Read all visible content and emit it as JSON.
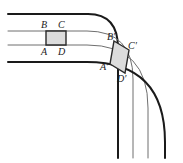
{
  "figure": {
    "canvas": {
      "width": 183,
      "height": 163
    },
    "colors": {
      "outer_stroke": "#1a1a1a",
      "inner_stroke": "#6f6f6f",
      "shape_stroke": "#2a2a2a",
      "shape_fill": "#dcdcdc",
      "background": "#ffffff",
      "label_color": "#1a1a1a"
    },
    "stroke_widths": {
      "outer": 2.0,
      "inner": 1.0,
      "shape": 1.4
    },
    "lanes": [
      {
        "name": "lane-edge-outer-top",
        "weight": "thick",
        "straight_y": 14,
        "vertical_x": 118,
        "corner_radius": 30
      },
      {
        "name": "lane-divider-upper",
        "weight": "thin",
        "straight_y": 31,
        "vertical_x": 133,
        "corner_radius": 46
      },
      {
        "name": "lane-divider-lower",
        "weight": "thin",
        "straight_y": 45,
        "vertical_x": 148,
        "corner_radius": 61
      },
      {
        "name": "lane-edge-outer-bottom",
        "weight": "thick",
        "straight_y": 62,
        "vertical_x": 165,
        "corner_radius": 78
      }
    ],
    "square": {
      "name": "square-ABCD",
      "points": "46,31 66,31 66,45 46,45",
      "fill": "#dcdcdc"
    },
    "parallelogram": {
      "name": "parallelogram-A-prime-B-prime-C-prime-D-prime",
      "points": "114,41 129,50 125,73 110,64",
      "fill": "#dcdcdc"
    },
    "labels": [
      {
        "id": "B",
        "text": "B",
        "x": 41,
        "y": 20
      },
      {
        "id": "C",
        "text": "C",
        "x": 58,
        "y": 20
      },
      {
        "id": "A",
        "text": "A",
        "x": 41,
        "y": 47
      },
      {
        "id": "D",
        "text": "D",
        "x": 58,
        "y": 47
      },
      {
        "id": "Bp",
        "text": "B′",
        "x": 107,
        "y": 32
      },
      {
        "id": "Cp",
        "text": "C′",
        "x": 128,
        "y": 41
      },
      {
        "id": "Ap",
        "text": "A′",
        "x": 100,
        "y": 62
      },
      {
        "id": "Dp",
        "text": "D′",
        "x": 117,
        "y": 74
      }
    ]
  }
}
